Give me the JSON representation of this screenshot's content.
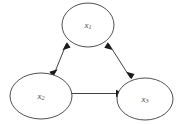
{
  "diagram": {
    "type": "undirected-cyclic-graph",
    "background_color": "#ffffff",
    "node_stroke_color": "#3c3c3c",
    "edge_color": "#2b2b2b",
    "label_color": "#4a4a4a",
    "nodes": [
      {
        "id": "x1",
        "label_base": "x",
        "label_subscript": "1",
        "label_full": "x₁",
        "cx": 88,
        "cy": 25,
        "rx": 26,
        "ry": 22
      },
      {
        "id": "x2",
        "label_base": "x",
        "label_subscript": "2",
        "label_full": "x₂",
        "cx": 41,
        "cy": 96,
        "rx": 31,
        "ry": 23
      },
      {
        "id": "x3",
        "label_base": "x",
        "label_subscript": "3",
        "label_full": "x₃",
        "cx": 145,
        "cy": 99,
        "rx": 28,
        "ry": 21
      }
    ],
    "edges": [
      {
        "id": "edge-x1-x2",
        "from": "x1",
        "to": "x2",
        "direction": "bidirectional",
        "arrowheads": "both"
      },
      {
        "id": "edge-x1-x3",
        "from": "x1",
        "to": "x3",
        "direction": "bidirectional",
        "arrowheads": "both"
      },
      {
        "id": "edge-x2-x3",
        "from": "x2",
        "to": "x3",
        "direction": "bidirectional",
        "arrowheads": "both"
      }
    ]
  }
}
